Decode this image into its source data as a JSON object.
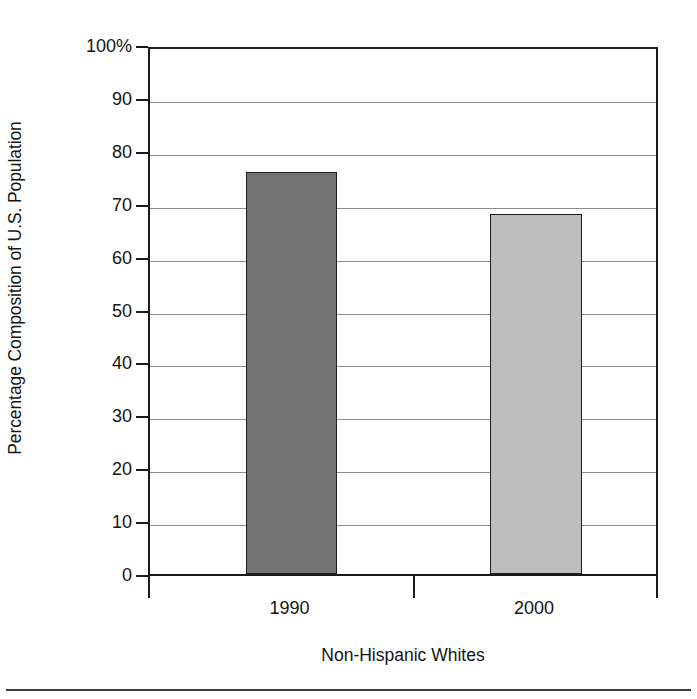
{
  "chart_data": {
    "type": "bar",
    "title": "",
    "subtitle": "",
    "xlabel": "Non-Hispanic Whites",
    "ylabel": "Percentage Composition of U.S. Population",
    "categories": [
      "1990",
      "2000"
    ],
    "values": [
      76,
      68
    ],
    "series": [
      {
        "name": "Non-Hispanic Whites",
        "values": [
          76,
          68
        ]
      }
    ],
    "ylim": [
      0,
      100
    ],
    "y_ticks": [
      0,
      10,
      20,
      30,
      40,
      50,
      60,
      70,
      80,
      90,
      100
    ],
    "y_tick_labels": [
      "0",
      "10",
      "20",
      "30",
      "40",
      "50",
      "60",
      "70",
      "80",
      "90",
      "100%"
    ],
    "grid": true,
    "legend": "none",
    "bar_colors": [
      "#737373",
      "#bdbdbd"
    ],
    "bar_edge_color": "#1f1f1f",
    "axis_color": "#1a1a1a",
    "gridline_color": "#8c8c8c",
    "background": "#ffffff"
  },
  "axes": {
    "y_title": "Percentage Composition of U.S. Population",
    "x_title": "Non-Hispanic Whites",
    "y_tick_labels": [
      "100%",
      "90",
      "80",
      "70",
      "60",
      "50",
      "40",
      "30",
      "20",
      "10",
      "0"
    ],
    "x_tick_labels": [
      "1990",
      "2000"
    ]
  }
}
